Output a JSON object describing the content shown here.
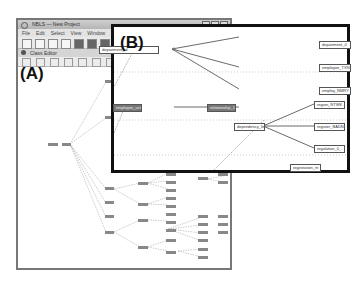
{
  "figure": {
    "label_a": "(A)",
    "label_b": "(B)"
  },
  "window": {
    "title": "NBLS — New Project",
    "menu": [
      "File",
      "Edit",
      "Select",
      "View",
      "Window",
      "Format",
      "Help"
    ],
    "subtab_title": "Class Editor"
  },
  "panel_b": {
    "nodes": [
      {
        "id": "n1",
        "label": "department_id",
        "style": "light"
      },
      {
        "id": "n2",
        "label": "department_0",
        "style": "light"
      },
      {
        "id": "n3",
        "label": "employee_TXN",
        "style": "light"
      },
      {
        "id": "n4",
        "label": "employ_NMRY",
        "style": "light"
      },
      {
        "id": "n5",
        "label": "employee_actor",
        "style": "dark"
      },
      {
        "id": "n6",
        "label": "relationship_1",
        "style": "dark"
      },
      {
        "id": "n7",
        "label": "dependency_link",
        "style": "light"
      },
      {
        "id": "n8",
        "label": "region_NTWK",
        "style": "light"
      },
      {
        "id": "n9",
        "label": "register_BADN",
        "style": "light"
      },
      {
        "id": "n10",
        "label": "regulation_0_",
        "style": "light"
      },
      {
        "id": "n11",
        "label": "registration_nt",
        "style": "light"
      }
    ]
  }
}
